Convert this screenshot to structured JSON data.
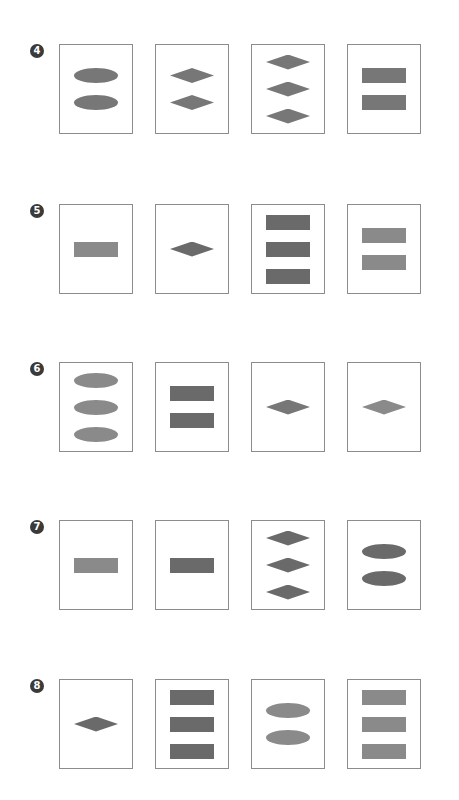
{
  "colors": {
    "dark": "#6a6a6a",
    "mid": "#777777",
    "light": "#8a8a8a",
    "border": "#8c8c8c",
    "badge": "#3a3a3a"
  },
  "rows": [
    {
      "label": "4",
      "top": 44,
      "cards": [
        {
          "shape": "ellipse",
          "count": 2,
          "shade": "mid"
        },
        {
          "shape": "diamond",
          "count": 2,
          "shade": "mid"
        },
        {
          "shape": "diamond",
          "count": 3,
          "shade": "mid"
        },
        {
          "shape": "rectangle",
          "count": 2,
          "shade": "mid"
        }
      ]
    },
    {
      "label": "5",
      "top": 204,
      "cards": [
        {
          "shape": "rectangle",
          "count": 1,
          "shade": "light"
        },
        {
          "shape": "diamond",
          "count": 1,
          "shade": "dark"
        },
        {
          "shape": "rectangle",
          "count": 3,
          "shade": "dark"
        },
        {
          "shape": "rectangle",
          "count": 2,
          "shade": "light"
        }
      ]
    },
    {
      "label": "6",
      "top": 362,
      "cards": [
        {
          "shape": "ellipse",
          "count": 3,
          "shade": "light"
        },
        {
          "shape": "rectangle",
          "count": 2,
          "shade": "dark"
        },
        {
          "shape": "diamond",
          "count": 1,
          "shade": "mid"
        },
        {
          "shape": "diamond",
          "count": 1,
          "shade": "light"
        }
      ]
    },
    {
      "label": "7",
      "top": 520,
      "cards": [
        {
          "shape": "rectangle",
          "count": 1,
          "shade": "light"
        },
        {
          "shape": "rectangle",
          "count": 1,
          "shade": "dark"
        },
        {
          "shape": "diamond",
          "count": 3,
          "shade": "dark"
        },
        {
          "shape": "ellipse",
          "count": 2,
          "shade": "dark"
        }
      ]
    },
    {
      "label": "8",
      "top": 679,
      "cards": [
        {
          "shape": "diamond",
          "count": 1,
          "shade": "dark"
        },
        {
          "shape": "rectangle",
          "count": 3,
          "shade": "dark"
        },
        {
          "shape": "ellipse",
          "count": 2,
          "shade": "light"
        },
        {
          "shape": "rectangle",
          "count": 3,
          "shade": "light"
        }
      ]
    }
  ],
  "card_lefts": [
    59,
    155,
    251,
    347
  ]
}
